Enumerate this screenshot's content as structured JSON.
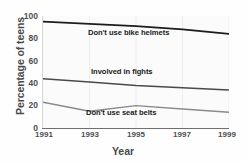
{
  "chart_data": {
    "type": "line",
    "title": "",
    "xlabel": "Year",
    "ylabel": "Percentage of teens",
    "x": [
      1991,
      1993,
      1995,
      1997,
      1999
    ],
    "xlim": [
      1991,
      1999
    ],
    "ylim": [
      0,
      100
    ],
    "xticks": [
      "1991",
      "1993",
      "1995",
      "1997",
      "1999"
    ],
    "yticks": [
      "0",
      "20",
      "40",
      "60",
      "80",
      "100"
    ],
    "ytick_values": [
      0,
      20,
      40,
      60,
      80,
      100
    ],
    "grid": false,
    "legend_position": "inline-labels",
    "series": [
      {
        "name": "Don't use bike helmets",
        "values": [
          95,
          93,
          91,
          88,
          84
        ],
        "color": "#1c1c1c",
        "width": 1.8,
        "label_x": 88,
        "label_y": 28
      },
      {
        "name": "Involved in fights",
        "values": [
          44,
          41,
          38,
          36,
          34
        ],
        "color": "#4a4a4a",
        "width": 1.5,
        "label_x": 91,
        "label_y": 67
      },
      {
        "name": "Don't use seat belts",
        "values": [
          23,
          15,
          20,
          17,
          14
        ],
        "color": "#8a8a8a",
        "width": 1.4,
        "label_x": 86,
        "label_y": 108
      }
    ]
  },
  "axes": {
    "y_title": "Percentage of teens",
    "x_title": "Year",
    "y_labels": [
      {
        "text": "100",
        "top": 12
      },
      {
        "text": "80",
        "top": 34
      },
      {
        "text": "60",
        "top": 57
      },
      {
        "text": "40",
        "top": 79
      },
      {
        "text": "20",
        "top": 101
      },
      {
        "text": "0",
        "top": 124
      }
    ],
    "x_labels": [
      {
        "text": "1991",
        "left": 44
      },
      {
        "text": "1993",
        "left": 90
      },
      {
        "text": "1995",
        "left": 136
      },
      {
        "text": "1997",
        "left": 182
      },
      {
        "text": "1999",
        "left": 227
      }
    ]
  }
}
